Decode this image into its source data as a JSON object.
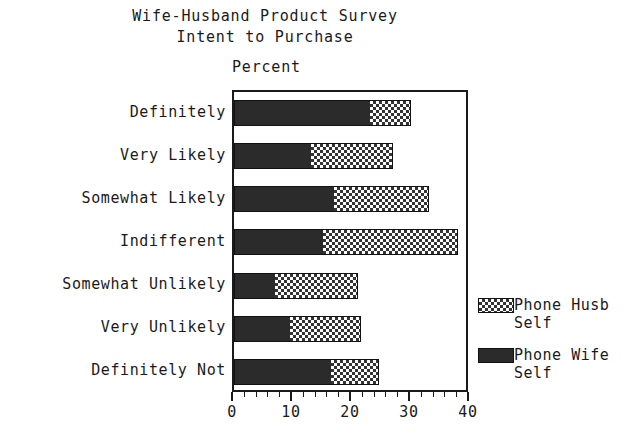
{
  "title": {
    "line1": "Wife-Husband Product Survey",
    "line2": "Intent to Purchase"
  },
  "axis_caption": "Percent",
  "legend": {
    "entries": [
      {
        "label": "Phone Husb",
        "sub": "Self",
        "pattern": "dotted",
        "color": "#333333"
      },
      {
        "label": "Phone Wife",
        "sub": "Self",
        "pattern": "solid",
        "color": "#2b2b2b"
      }
    ]
  },
  "chart_data": {
    "type": "bar",
    "orientation": "horizontal",
    "stacked": true,
    "title": "Wife-Husband Product Survey Intent to Purchase",
    "xlabel": "Percent",
    "ylabel": "",
    "xlim": [
      0,
      40
    ],
    "xticks": [
      0,
      10,
      20,
      30,
      40
    ],
    "xtick_labels": [
      "0",
      "10",
      "20",
      "30",
      "40"
    ],
    "minor_tick_interval": 2,
    "grid": false,
    "legend_position": "right",
    "categories": [
      "Definitely",
      "Very Likely",
      "Somewhat Likely",
      "Indifferent",
      "Somewhat Unlikely",
      "Very Unlikely",
      "Definitely Not"
    ],
    "series": [
      {
        "name": "Phone Wife Self",
        "values": [
          23,
          13,
          17,
          15,
          7,
          9.5,
          16.5
        ]
      },
      {
        "name": "Phone Husb Self",
        "values": [
          7,
          14,
          16,
          23,
          14,
          12,
          8
        ]
      }
    ],
    "totals": [
      30,
      27,
      33,
      38,
      21,
      21.5,
      24.5
    ]
  }
}
